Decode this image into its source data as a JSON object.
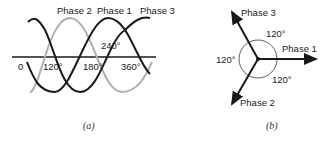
{
  "panel_a": {
    "phase_labels": [
      "Phase 2",
      "Phase 1",
      "Phase 3"
    ],
    "axis_labels": [
      "0",
      "120°",
      "180°",
      "240°",
      "360°"
    ],
    "caption": "(a)",
    "colors": {
      "dark": "#1a1a1a",
      "gray": "#b0b0b0"
    }
  },
  "panel_b": {
    "phase_labels": [
      "Phase 1",
      "Phase 2",
      "Phase 3"
    ],
    "angle_labels": [
      "120°",
      "120°",
      "120°"
    ],
    "caption": "(b)"
  }
}
